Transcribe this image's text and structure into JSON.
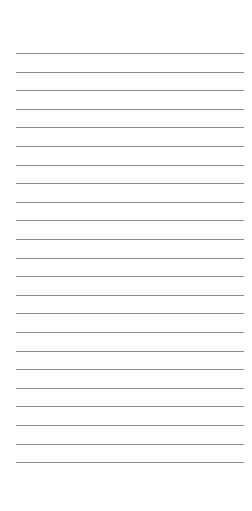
{
  "sheet": {
    "type": "lined-paper",
    "background": "#ffffff",
    "line_color": "#8c8c8c",
    "line_count": 23,
    "first_line_y": 53,
    "line_spacing": 18.6,
    "line_left": 16,
    "line_width": 228,
    "lines": [
      "",
      "",
      "",
      "",
      "",
      "",
      "",
      "",
      "",
      "",
      "",
      "",
      "",
      "",
      "",
      "",
      "",
      "",
      "",
      "",
      "",
      "",
      ""
    ]
  }
}
